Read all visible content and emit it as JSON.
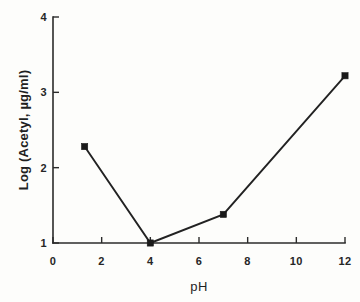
{
  "chart_data": {
    "type": "line",
    "title": "",
    "subtitle": "",
    "xlabel": "pH",
    "ylabel": "Log (Acetyl, µg/ml)",
    "xlim": [
      0,
      12
    ],
    "ylim": [
      1,
      4
    ],
    "xticks": [
      "0",
      "2",
      "4",
      "6",
      "8",
      "10",
      "12"
    ],
    "xtick_values": [
      0,
      2,
      4,
      6,
      8,
      10,
      12
    ],
    "yticks": [
      "1",
      "2",
      "3",
      "4"
    ],
    "ytick_values": [
      1,
      2,
      3,
      4
    ],
    "grid": false,
    "legend": null,
    "legend_position": "none",
    "line_color": "#222222",
    "marker_color": "#1a1a1a",
    "marker_shape": "square",
    "axis_color": "#2b2b2b",
    "background_color": "#fdfdfb",
    "series": [
      {
        "name": "Acetyl",
        "x": [
          1.3,
          4.0,
          7.0,
          12.0
        ],
        "y": [
          2.28,
          1.0,
          1.38,
          3.22
        ],
        "points": [
          {
            "x": 1.3,
            "y": 2.28
          },
          {
            "x": 4.0,
            "y": 1.0
          },
          {
            "x": 7.0,
            "y": 1.38
          },
          {
            "x": 12.0,
            "y": 3.22
          }
        ]
      }
    ],
    "annotations": []
  },
  "figure": {
    "x_axis_title": "pH",
    "y_axis_title": "Log (Acetyl, µg/ml)"
  }
}
